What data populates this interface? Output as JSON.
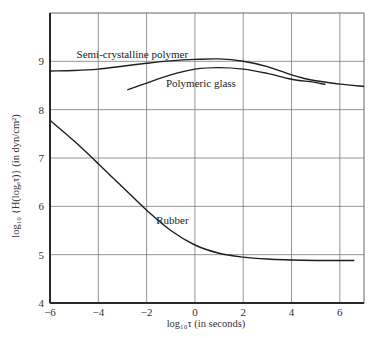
{
  "chart_data": {
    "type": "line",
    "title": "",
    "xlabel": "log₁₀τ (in seconds)",
    "ylabel": "log₁₀ {H(logₑτ)} (in dyn/cm²)",
    "xlim": [
      -6,
      7
    ],
    "ylim": [
      4,
      10
    ],
    "grid": true,
    "legend": "inline labels",
    "x_ticks": [
      "-6",
      "-4",
      "-2",
      "0",
      "2",
      "4",
      "6"
    ],
    "x_tick_values": [
      -6,
      -4,
      -2,
      0,
      2,
      4,
      6
    ],
    "y_ticks": [
      "4",
      "5",
      "6",
      "7",
      "8",
      "9"
    ],
    "y_tick_values": [
      4,
      5,
      6,
      7,
      8,
      9
    ],
    "series": [
      {
        "name": "Semi-crystalline polymer",
        "label_pos": [
          -4.9,
          9.06
        ],
        "x": [
          -6,
          -5,
          -4,
          -3,
          -2,
          -1,
          0,
          1,
          2,
          3,
          4,
          4.5,
          5,
          6,
          7
        ],
        "values": [
          8.8,
          8.81,
          8.84,
          8.9,
          8.96,
          9.01,
          9.04,
          9.05,
          9.0,
          8.89,
          8.72,
          8.65,
          8.6,
          8.53,
          8.48
        ]
      },
      {
        "name": "Polymeric glass",
        "label_pos": [
          -1.2,
          8.47
        ],
        "x": [
          -2.8,
          -2,
          -1,
          0,
          1,
          2,
          3,
          4,
          4.9,
          5.4
        ],
        "values": [
          8.41,
          8.55,
          8.72,
          8.84,
          8.87,
          8.84,
          8.75,
          8.63,
          8.57,
          8.52
        ]
      },
      {
        "name": "Rubber",
        "label_pos": [
          -1.6,
          5.63
        ],
        "x": [
          -6,
          -5,
          -4,
          -3,
          -2,
          -1,
          0,
          1,
          2,
          3,
          4,
          5,
          6,
          6.6
        ],
        "values": [
          7.78,
          7.35,
          6.88,
          6.4,
          5.92,
          5.5,
          5.2,
          5.03,
          4.95,
          4.91,
          4.89,
          4.88,
          4.88,
          4.88
        ]
      }
    ]
  },
  "colors": {
    "background": "#ffffff",
    "line": "#1e1e1e",
    "grid": "#7a7a7a"
  }
}
